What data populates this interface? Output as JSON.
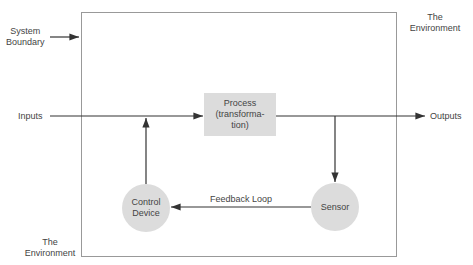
{
  "diagram": {
    "labels": {
      "system_boundary": [
        "System",
        "Boundary"
      ],
      "env_top": [
        "The",
        "Environment"
      ],
      "env_bottom": [
        "The",
        "Environment"
      ],
      "inputs": "Inputs",
      "outputs": "Outputs",
      "feedback_loop": "Feedback Loop"
    },
    "nodes": {
      "process": [
        "Process",
        "(transforma-",
        "tion)"
      ],
      "control_device": [
        "Control",
        "Device"
      ],
      "sensor": "Sensor"
    },
    "colors": {
      "node_fill": "#dcdcdc",
      "line": "#333333",
      "boundary": "#999999"
    }
  }
}
